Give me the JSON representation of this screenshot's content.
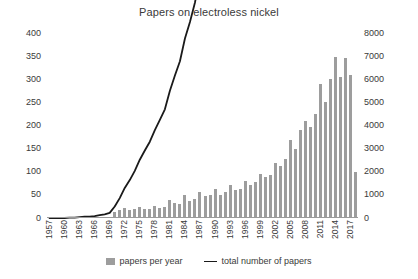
{
  "chart_data": {
    "type": "bar",
    "title": "Papers on electroless nickel",
    "xlabel": "",
    "ylabel": "",
    "grid": false,
    "legend_position": "bottom",
    "xlim": [
      1957,
      2018
    ],
    "ylim": [
      0,
      400
    ],
    "y2lim": [
      0,
      8000
    ],
    "yticks": [
      0,
      50,
      100,
      150,
      200,
      250,
      300,
      350,
      400
    ],
    "y2ticks": [
      0,
      1000,
      2000,
      3000,
      4000,
      5000,
      6000,
      7000,
      8000
    ],
    "xticks": [
      1957,
      1960,
      1963,
      1966,
      1969,
      1972,
      1975,
      1978,
      1981,
      1984,
      1987,
      1990,
      1993,
      1996,
      1999,
      2002,
      2005,
      2008,
      2011,
      2014,
      2017
    ],
    "x": [
      1957,
      1958,
      1959,
      1960,
      1961,
      1962,
      1963,
      1964,
      1965,
      1966,
      1967,
      1968,
      1969,
      1970,
      1971,
      1972,
      1973,
      1974,
      1975,
      1976,
      1977,
      1978,
      1979,
      1980,
      1981,
      1982,
      1983,
      1984,
      1985,
      1986,
      1987,
      1988,
      1989,
      1990,
      1991,
      1992,
      1993,
      1994,
      1995,
      1996,
      1997,
      1998,
      1999,
      2000,
      2001,
      2002,
      2003,
      2004,
      2005,
      2006,
      2007,
      2008,
      2009,
      2010,
      2011,
      2012,
      2013,
      2014,
      2015,
      2016,
      2017,
      2018
    ],
    "series": [
      {
        "name": "papers per year",
        "axis": "left",
        "kind": "bar",
        "color": "#9d9d9d",
        "values": [
          0,
          0,
          0,
          0,
          1,
          0,
          1,
          1,
          0,
          1,
          2,
          2,
          3,
          14,
          18,
          22,
          17,
          20,
          24,
          20,
          19,
          25,
          22,
          23,
          40,
          33,
          31,
          49,
          36,
          42,
          57,
          47,
          49,
          62,
          49,
          56,
          72,
          60,
          63,
          80,
          72,
          78,
          96,
          88,
          92,
          120,
          112,
          128,
          168,
          150,
          190,
          210,
          196,
          225,
          290,
          250,
          300,
          348,
          305,
          345,
          310,
          100
        ]
      },
      {
        "name": "total number of papers",
        "axis": "right",
        "kind": "line",
        "color": "#1a1a1a",
        "values": [
          0,
          0,
          0,
          0,
          20,
          20,
          40,
          60,
          60,
          80,
          120,
          160,
          220,
          500,
          860,
          1300,
          1640,
          2040,
          2520,
          2920,
          3300,
          3800,
          4240,
          4700,
          5500,
          6160,
          6780,
          7760,
          8480,
          9320,
          10460,
          11400,
          12380,
          13620,
          14600,
          15720,
          17160,
          18360,
          19620,
          21220,
          22660,
          24220,
          26140,
          27900,
          29740,
          32140,
          34380,
          36940,
          40300,
          43300,
          47100,
          51300,
          55220,
          59720,
          65520,
          70520,
          76520,
          83480,
          89580,
          96480,
          102680,
          104680
        ]
      }
    ],
    "notes": {
      "first_nonzero_year": 1961,
      "takeoff_year": 1970,
      "peak_bar_year": 2014,
      "peak_bar_value": 348,
      "final_partial_year": 2018,
      "final_total_on_right_axis": 7600
    }
  },
  "legend": {
    "entries": [
      {
        "label": "papers per year",
        "marker": "bar-swatch"
      },
      {
        "label": "total number of papers",
        "marker": "line-swatch"
      }
    ]
  }
}
